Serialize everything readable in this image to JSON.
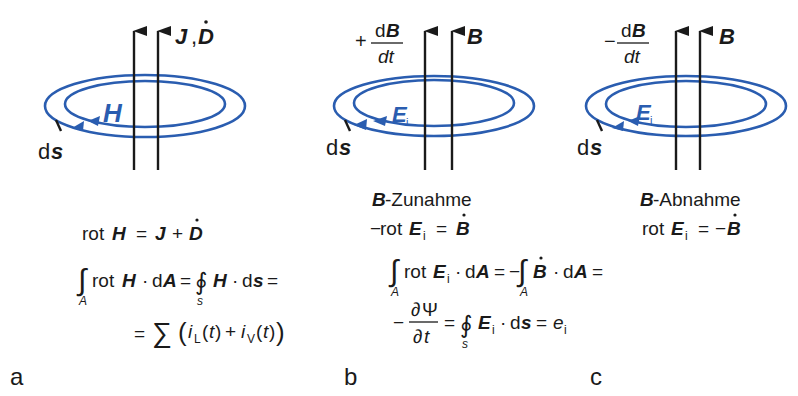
{
  "colors": {
    "field_loop": "#2a5db0",
    "arrows": "#1a1a1a",
    "text": "#1a1a1a"
  },
  "panels": [
    {
      "id": "a",
      "panel_label": "a",
      "flux_label": "J, Ḋ",
      "flux_label_J": "J",
      "flux_label_sep": ",",
      "flux_label_D": "D",
      "field_label": "H",
      "ds_d": "d",
      "ds_s": "s",
      "equations": {
        "line1": "rot H = J + Ḋ",
        "line2": "∫A rot H · dA = ∮s H · ds =",
        "line3": "= ∑(iL(t) + iV(t))"
      }
    },
    {
      "id": "b",
      "panel_label": "b",
      "rate_sign": "+",
      "rate_num_d": "d",
      "rate_num_B": "B",
      "rate_den": "dt",
      "flux_label": "B",
      "field_label": "E",
      "field_sub": "i",
      "ds_d": "d",
      "ds_s": "s",
      "caption_B": "B",
      "caption_rest": "-Zunahme",
      "equations": {
        "line1": "−rot Ei = Ḃ",
        "line2": "∫A rot Ei · dA = −∫A Ḃ · dA =",
        "line3": "−∂Ψ/∂t = ∮s Ei · ds = ei"
      }
    },
    {
      "id": "c",
      "panel_label": "c",
      "rate_sign": "−",
      "rate_num_d": "d",
      "rate_num_B": "B",
      "rate_den": "dt",
      "flux_label": "B",
      "field_label": "E",
      "field_sub": "i",
      "ds_d": "d",
      "ds_s": "s",
      "caption_B": "B",
      "caption_rest": "-Abnahme",
      "equations": {
        "line1": "rot Ei = −Ḃ"
      }
    }
  ],
  "glyphs": {
    "rot": "rot",
    "H": "H",
    "J": "J",
    "D": "D",
    "E": "E",
    "B": "B",
    "A": "A",
    "s": "s",
    "d": "d",
    "i": "i",
    "t": "t",
    "e": "e",
    "L": "L",
    "V": "V",
    "eq": "=",
    "plus": "+",
    "minus": "−",
    "cdot": "·",
    "dot": "˙",
    "integral": "∫",
    "contour": "∮",
    "sum": "∑",
    "partial": "∂",
    "Psi": "Ψ",
    "lparen": "(",
    "rparen": ")",
    "big_lparen": "(",
    "big_rparen": ")"
  }
}
